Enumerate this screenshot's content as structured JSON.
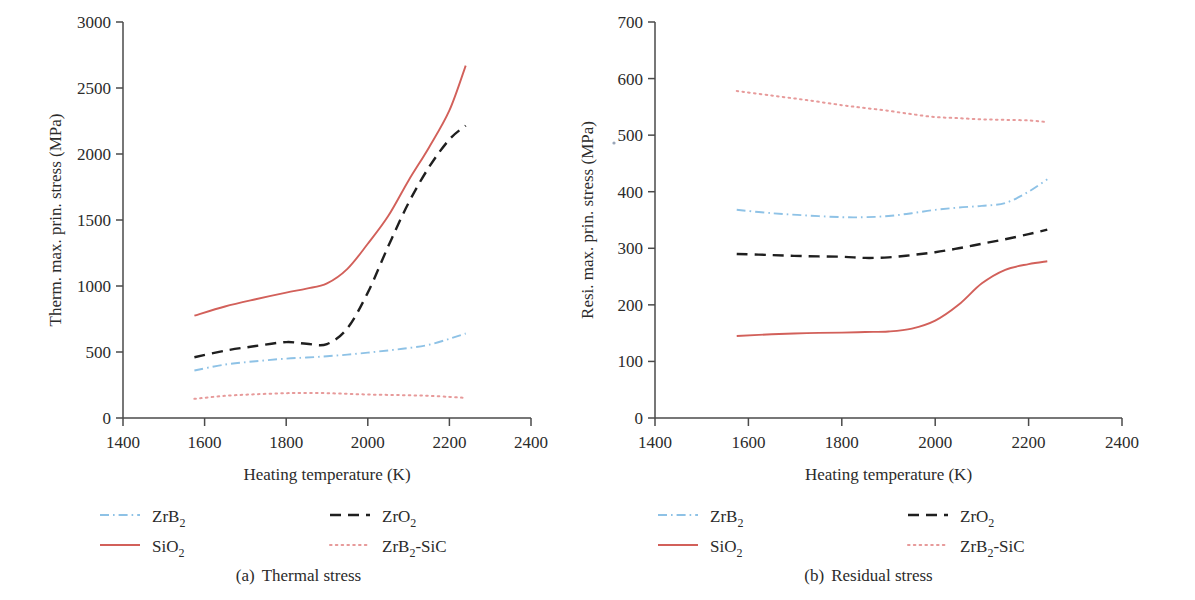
{
  "figure": {
    "panels": [
      {
        "id": "a",
        "caption_tag": "(a)",
        "caption_text": "Thermal stress"
      },
      {
        "id": "b",
        "caption_tag": "(b)",
        "caption_text": "Residual stress"
      }
    ]
  },
  "chart_data": [
    {
      "type": "line",
      "panel": "a",
      "title": "(a) Thermal stress",
      "xlabel": "Heating temperature (K)",
      "ylabel": "Therm. max. prin. stress (MPa)",
      "xlim": [
        1400,
        2400
      ],
      "ylim": [
        0,
        3000
      ],
      "xticks": [
        1400,
        1600,
        1800,
        2000,
        2200,
        2400
      ],
      "yticks": [
        0,
        500,
        1000,
        1500,
        2000,
        2500,
        3000
      ],
      "grid": false,
      "legend_position": "below-axes",
      "x": [
        1575,
        1650,
        1725,
        1800,
        1850,
        1900,
        1950,
        2000,
        2050,
        2100,
        2150,
        2200,
        2240
      ],
      "series": [
        {
          "name": "ZrB2",
          "label": "ZrB₂",
          "style": "dashdot",
          "color": "#8ec2e6",
          "values": [
            360,
            405,
            430,
            450,
            458,
            468,
            480,
            495,
            512,
            530,
            555,
            600,
            640
          ]
        },
        {
          "name": "ZrO2",
          "label": "ZrO₂",
          "style": "dashed",
          "color": "#1f1f1f",
          "values": [
            460,
            510,
            545,
            575,
            562,
            560,
            680,
            950,
            1300,
            1630,
            1900,
            2110,
            2215
          ]
        },
        {
          "name": "SiO2",
          "label": "SiO₂",
          "style": "solid",
          "color": "#d2605a",
          "values": [
            775,
            845,
            900,
            950,
            980,
            1020,
            1130,
            1320,
            1530,
            1800,
            2050,
            2330,
            2670
          ]
        },
        {
          "name": "ZrB2-SiC",
          "label": "ZrB₂-SiC",
          "style": "dotted",
          "color": "#e79a9a",
          "values": [
            145,
            168,
            180,
            188,
            190,
            188,
            183,
            178,
            175,
            172,
            168,
            160,
            152
          ]
        }
      ]
    },
    {
      "type": "line",
      "panel": "b",
      "title": "(b) Residual stress",
      "xlabel": "Heating temperature (K)",
      "ylabel": "Resi. max. prin. stress (MPa)",
      "xlim": [
        1400,
        2400
      ],
      "ylim": [
        0,
        700
      ],
      "xticks": [
        1400,
        1600,
        1800,
        2000,
        2200,
        2400
      ],
      "yticks": [
        0,
        100,
        200,
        300,
        400,
        500,
        600,
        700
      ],
      "grid": false,
      "legend_position": "below-axes",
      "x": [
        1575,
        1650,
        1725,
        1800,
        1850,
        1900,
        1950,
        2000,
        2050,
        2100,
        2150,
        2200,
        2240
      ],
      "series": [
        {
          "name": "ZrB2",
          "label": "ZrB₂",
          "style": "dashdot",
          "color": "#8ec2e6",
          "values": [
            368,
            362,
            358,
            355,
            355,
            357,
            362,
            368,
            372,
            375,
            380,
            400,
            422
          ]
        },
        {
          "name": "ZrO2",
          "label": "ZrO₂",
          "style": "dashed",
          "color": "#1f1f1f",
          "values": [
            290,
            288,
            286,
            285,
            283,
            284,
            288,
            293,
            300,
            308,
            316,
            325,
            333
          ]
        },
        {
          "name": "SiO2",
          "label": "SiO₂",
          "style": "solid",
          "color": "#d2605a",
          "values": [
            145,
            148,
            150,
            151,
            152,
            153,
            158,
            172,
            200,
            238,
            262,
            272,
            277
          ]
        },
        {
          "name": "ZrB2-SiC",
          "label": "ZrB₂-SiC",
          "style": "dotted",
          "color": "#e79a9a",
          "values": [
            578,
            570,
            562,
            553,
            548,
            543,
            537,
            532,
            530,
            528,
            527,
            526,
            523
          ]
        }
      ]
    }
  ],
  "panel_a": {
    "ylabel": "Therm. max. prin. stress (MPa)",
    "xlabel": "Heating temperature (K)",
    "yticks": [
      "3000",
      "2500",
      "2000",
      "1500",
      "1000",
      "500",
      "0"
    ],
    "xticks": [
      "1400",
      "1600",
      "1800",
      "2000",
      "2200",
      "2400"
    ],
    "legend": {
      "zrb2": "ZrB",
      "zrb2_sub": "2",
      "zro2": "ZrO",
      "zro2_sub": "2",
      "sio2": "SiO",
      "sio2_sub": "2",
      "zrb2sic_a": "ZrB",
      "zrb2sic_sub": "2",
      "zrb2sic_b": "-SiC"
    },
    "caption_tag": "(a)",
    "caption_text": "Thermal stress"
  },
  "panel_b": {
    "ylabel": "Resi. max. prin. stress (MPa)",
    "xlabel": "Heating temperature (K)",
    "yticks": [
      "700",
      "600",
      "500",
      "400",
      "300",
      "200",
      "100",
      "0"
    ],
    "xticks": [
      "1400",
      "1600",
      "1800",
      "2000",
      "2200",
      "2400"
    ],
    "legend": {
      "zrb2": "ZrB",
      "zrb2_sub": "2",
      "zro2": "ZrO",
      "zro2_sub": "2",
      "sio2": "SiO",
      "sio2_sub": "2",
      "zrb2sic_a": "ZrB",
      "zrb2sic_sub": "2",
      "zrb2sic_b": "-SiC"
    },
    "caption_tag": "(b)",
    "caption_text": "Residual stress"
  },
  "colors": {
    "zrb2": "#8ec2e6",
    "zro2": "#1f1f1f",
    "sio2": "#d2605a",
    "zrb2sic": "#e79a9a",
    "axis": "#4a4a4a",
    "text": "#2b2b2b"
  }
}
